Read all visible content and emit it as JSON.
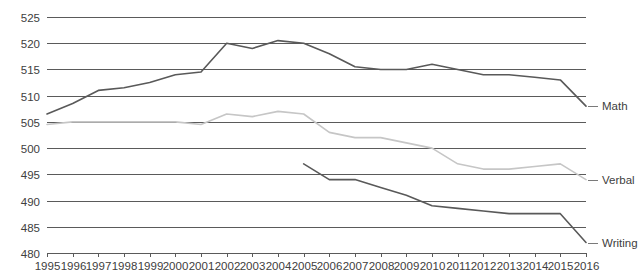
{
  "chart_data": {
    "type": "line",
    "title": "",
    "subtitle": "",
    "xlabel": "",
    "ylabel": "",
    "xlim": [
      1995,
      2016
    ],
    "ylim": [
      480,
      525
    ],
    "ytick_step": 5,
    "grid": "horizontal",
    "legend_position": "right-inline",
    "categories": [
      1995,
      1996,
      1997,
      1998,
      1999,
      2000,
      2001,
      2002,
      2003,
      2004,
      2005,
      2006,
      2007,
      2008,
      2009,
      2010,
      2011,
      2012,
      2013,
      2014,
      2015,
      2016
    ],
    "xtick_labels": [
      "1995",
      "1996",
      "1997",
      "1998",
      "1999",
      "2000",
      "2001",
      "2002",
      "2003",
      "2004",
      "2005",
      "2006",
      "2007",
      "2008",
      "2009",
      "2010",
      "2011",
      "2012",
      "2013",
      "2014",
      "2015",
      "2016"
    ],
    "ytick_labels": [
      "480",
      "485",
      "490",
      "495",
      "500",
      "505",
      "510",
      "515",
      "520",
      "525"
    ],
    "series": [
      {
        "name": "Math",
        "color": "#595959",
        "x": [
          1995,
          1996,
          1997,
          1998,
          1999,
          2000,
          2001,
          2002,
          2003,
          2004,
          2005,
          2006,
          2007,
          2008,
          2009,
          2010,
          2011,
          2012,
          2013,
          2014,
          2015,
          2016
        ],
        "values": [
          506.5,
          508.5,
          511,
          511.5,
          512.5,
          514,
          514.5,
          520,
          519,
          520.5,
          520,
          518,
          515.5,
          515,
          515,
          516,
          515,
          514,
          514,
          513.5,
          513,
          508
        ]
      },
      {
        "name": "Verbal",
        "color": "#c6c6c6",
        "x": [
          1995,
          1996,
          1997,
          1998,
          1999,
          2000,
          2001,
          2002,
          2003,
          2004,
          2005,
          2006,
          2007,
          2008,
          2009,
          2010,
          2011,
          2012,
          2013,
          2014,
          2015,
          2016
        ],
        "values": [
          504.5,
          505,
          505,
          505,
          505,
          505,
          504.5,
          506.5,
          506,
          507,
          506.5,
          503,
          502,
          502,
          501,
          500,
          497,
          496,
          496,
          496.5,
          497,
          494
        ]
      },
      {
        "name": "Writing",
        "color": "#595959",
        "x": [
          2005,
          2006,
          2007,
          2008,
          2009,
          2010,
          2011,
          2012,
          2013,
          2014,
          2015,
          2016
        ],
        "values": [
          497,
          494,
          494,
          492.5,
          491,
          489,
          488.5,
          488,
          487.5,
          487.5,
          487.5,
          482
        ]
      }
    ],
    "series_labels": [
      {
        "text": "Math",
        "value": 508
      },
      {
        "text": "Verbal",
        "value": 494
      },
      {
        "text": "Writing",
        "value": 482
      }
    ]
  }
}
